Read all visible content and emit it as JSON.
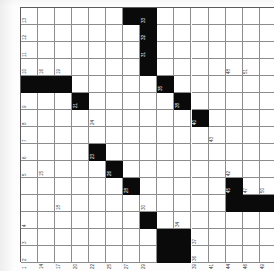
{
  "document": {
    "type": "crossword-grid",
    "orientation": "rotated-90",
    "title": "Crossword Puzzle Grid"
  },
  "grid": {
    "columns": 15,
    "rows": 15,
    "cell_size": 17.05,
    "block_color": "#0a0a0a",
    "cell_color": "#ffffff",
    "line_color": "#8d8d8d",
    "number_color": "#3a3a3a",
    "blocks": [
      [
        0,
        6
      ],
      [
        0,
        7
      ],
      [
        1,
        7
      ],
      [
        2,
        7
      ],
      [
        4,
        0
      ],
      [
        4,
        1
      ],
      [
        4,
        2
      ],
      [
        4,
        8
      ],
      [
        3,
        7
      ],
      [
        5,
        3
      ],
      [
        5,
        9
      ],
      [
        6,
        10
      ],
      [
        8,
        4
      ],
      [
        9,
        5
      ],
      [
        10,
        6
      ],
      [
        10,
        12
      ],
      [
        11,
        13
      ],
      [
        11,
        14
      ],
      [
        12,
        7
      ],
      [
        13,
        8
      ],
      [
        14,
        8
      ],
      [
        13,
        9
      ],
      [
        14,
        9
      ],
      [
        11,
        12
      ]
    ],
    "numbers": [
      {
        "r": 0,
        "c": 0,
        "n": "13"
      },
      {
        "r": 0,
        "c": 7,
        "n": "33"
      },
      {
        "r": 1,
        "c": 0,
        "n": "12"
      },
      {
        "r": 1,
        "c": 7,
        "n": "32"
      },
      {
        "r": 2,
        "c": 0,
        "n": "11"
      },
      {
        "r": 2,
        "c": 7,
        "n": "31"
      },
      {
        "r": 3,
        "c": 0,
        "n": "10"
      },
      {
        "r": 3,
        "c": 1,
        "n": "16"
      },
      {
        "r": 3,
        "c": 2,
        "n": "19"
      },
      {
        "r": 3,
        "c": 12,
        "n": "48"
      },
      {
        "r": 3,
        "c": 13,
        "n": "51"
      },
      {
        "r": 4,
        "c": 8,
        "n": "35"
      },
      {
        "r": 5,
        "c": 0,
        "n": "9"
      },
      {
        "r": 5,
        "c": 3,
        "n": "21"
      },
      {
        "r": 5,
        "c": 9,
        "n": "38"
      },
      {
        "r": 6,
        "c": 0,
        "n": "8"
      },
      {
        "r": 6,
        "c": 4,
        "n": "24"
      },
      {
        "r": 6,
        "c": 10,
        "n": "40"
      },
      {
        "r": 7,
        "c": 0,
        "n": "7"
      },
      {
        "r": 7,
        "c": 11,
        "n": "43"
      },
      {
        "r": 8,
        "c": 0,
        "n": "6"
      },
      {
        "r": 8,
        "c": 4,
        "n": "23"
      },
      {
        "r": 9,
        "c": 0,
        "n": "5"
      },
      {
        "r": 9,
        "c": 1,
        "n": "15"
      },
      {
        "r": 9,
        "c": 5,
        "n": "26"
      },
      {
        "r": 9,
        "c": 12,
        "n": "42"
      },
      {
        "r": 10,
        "c": 6,
        "n": "28"
      },
      {
        "r": 10,
        "c": 12,
        "n": "45"
      },
      {
        "r": 10,
        "c": 13,
        "n": "47"
      },
      {
        "r": 10,
        "c": 14,
        "n": "50"
      },
      {
        "r": 11,
        "c": 2,
        "n": "18"
      },
      {
        "r": 11,
        "c": 7,
        "n": "30"
      },
      {
        "r": 12,
        "c": 0,
        "n": "4"
      },
      {
        "r": 12,
        "c": 9,
        "n": "34"
      },
      {
        "r": 13,
        "c": 0,
        "n": "3"
      },
      {
        "r": 13,
        "c": 10,
        "n": "37"
      },
      {
        "r": 14,
        "c": 0,
        "n": "2"
      },
      {
        "r": 14,
        "c": 10,
        "n": "36"
      }
    ],
    "bottom_row_numbers": [
      {
        "r": 15,
        "c": 0,
        "n": "1"
      },
      {
        "r": 15,
        "c": 1,
        "n": "14"
      },
      {
        "r": 15,
        "c": 2,
        "n": "17"
      },
      {
        "r": 15,
        "c": 3,
        "n": "20"
      },
      {
        "r": 15,
        "c": 4,
        "n": "22"
      },
      {
        "r": 15,
        "c": 5,
        "n": "25"
      },
      {
        "r": 15,
        "c": 6,
        "n": "27"
      },
      {
        "r": 15,
        "c": 7,
        "n": "29"
      },
      {
        "r": 15,
        "c": 10,
        "n": "39"
      },
      {
        "r": 15,
        "c": 11,
        "n": "41"
      },
      {
        "r": 15,
        "c": 12,
        "n": "44"
      },
      {
        "r": 15,
        "c": 13,
        "n": "46"
      },
      {
        "r": 15,
        "c": 14,
        "n": "49"
      }
    ]
  }
}
